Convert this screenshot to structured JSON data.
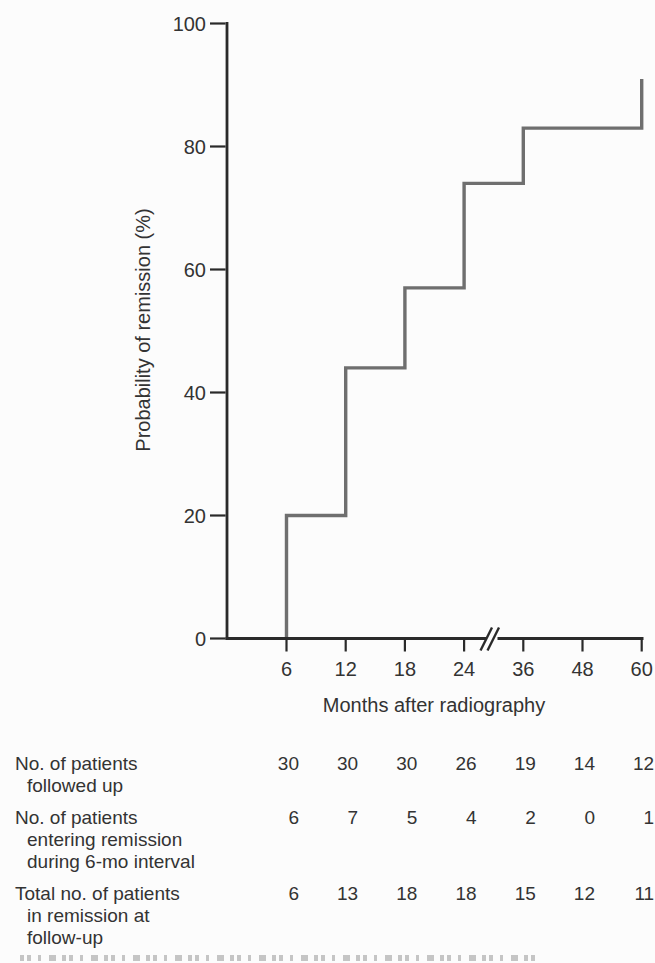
{
  "figure": {
    "colors": {
      "background": "#fcfcfc",
      "ink": "#333333",
      "axis": "#2a2a2a",
      "curve": "#6f6f6f"
    }
  },
  "chart_data": {
    "type": "line",
    "line_style": "step",
    "title": "",
    "xlabel": "Months after radiography",
    "ylabel": "Probability of remission (%)",
    "x_ticks": [
      6,
      12,
      18,
      24,
      36,
      48,
      60
    ],
    "x_tick_labels": [
      "6",
      "12",
      "18",
      "24",
      "36",
      "48",
      "60"
    ],
    "y_ticks": [
      100,
      80,
      60,
      40,
      20,
      0
    ],
    "y_tick_labels": [
      "100",
      "80",
      "60",
      "40",
      "20",
      "0"
    ],
    "ylim": [
      0,
      100
    ],
    "x_axis_break_between": [
      24,
      36
    ],
    "grid": false,
    "legend": "none",
    "series": [
      {
        "name": "Probability of remission",
        "x": [
          6,
          12,
          18,
          24,
          36,
          60
        ],
        "y": [
          20,
          44,
          57,
          74,
          83,
          91
        ]
      }
    ]
  },
  "table": {
    "columns_months": [
      "6",
      "12",
      "18",
      "24",
      "36",
      "48",
      "60"
    ],
    "rows": [
      {
        "label_lines": [
          "No. of patients",
          "followed up"
        ],
        "values": [
          "30",
          "30",
          "30",
          "26",
          "19",
          "14",
          "12"
        ]
      },
      {
        "label_lines": [
          "No. of patients",
          "entering remission",
          "during 6-mo interval"
        ],
        "values": [
          "6",
          "7",
          "5",
          "4",
          "2",
          "0",
          "1"
        ]
      },
      {
        "label_lines": [
          "Total no. of patients",
          "in remission at",
          "follow-up"
        ],
        "values": [
          "6",
          "13",
          "18",
          "18",
          "15",
          "12",
          "11"
        ]
      }
    ]
  }
}
